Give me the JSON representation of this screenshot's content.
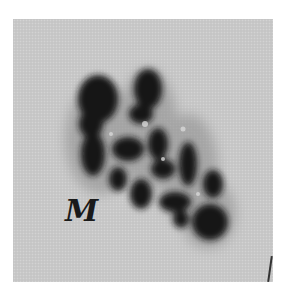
{
  "figure": {
    "label": "M",
    "panel_background": "#c9c9c9",
    "specimen_color": "#141414"
  }
}
